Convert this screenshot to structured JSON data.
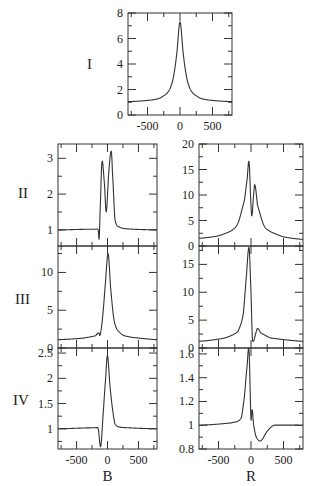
{
  "figure": {
    "row_labels": [
      "I",
      "II",
      "III",
      "IV"
    ],
    "column_labels": [
      "B",
      "R"
    ]
  },
  "chart_data": [
    {
      "id": "I",
      "type": "line",
      "title": "",
      "row_label": "I",
      "xlabel": "",
      "ylabel": "",
      "xlim": [
        -800,
        800
      ],
      "ylim": [
        0,
        8
      ],
      "xticks": [
        -500,
        0,
        500
      ],
      "yticks": [
        0,
        2,
        4,
        6,
        8
      ],
      "grid": false,
      "description": "Single symmetric Lorentzian-like peak centered at 0",
      "x": [
        -800,
        -600,
        -400,
        -300,
        -200,
        -150,
        -100,
        -50,
        0,
        50,
        100,
        150,
        200,
        300,
        400,
        600,
        800
      ],
      "values": [
        1.05,
        1.1,
        1.2,
        1.35,
        1.7,
        2.1,
        3.0,
        4.8,
        7.3,
        4.8,
        3.0,
        2.1,
        1.7,
        1.35,
        1.2,
        1.1,
        1.05
      ]
    },
    {
      "id": "II-B",
      "type": "line",
      "row_label": "II",
      "xlabel": "",
      "xlim": [
        -800,
        800
      ],
      "ylim": [
        0.5,
        3.4
      ],
      "xticks": [
        -500,
        0,
        500
      ],
      "yticks": [
        1,
        2,
        3
      ],
      "grid": false,
      "description": "Flat at 1 with small dip near -130, then double peak (2.9 at -90, dip 1.5 at -20, 3.2 at 60)",
      "x": [
        -800,
        -200,
        -150,
        -135,
        -120,
        -90,
        -50,
        -20,
        20,
        60,
        80,
        120,
        200,
        400,
        800
      ],
      "values": [
        1.0,
        1.02,
        1.0,
        0.75,
        1.5,
        2.9,
        2.3,
        1.5,
        2.6,
        3.2,
        2.6,
        1.3,
        1.07,
        1.02,
        1.0
      ]
    },
    {
      "id": "II-R",
      "type": "line",
      "row_label": "II",
      "xlim": [
        -800,
        800
      ],
      "ylim": [
        0,
        20
      ],
      "xticks": [
        -500,
        0,
        500
      ],
      "yticks": [
        0,
        5,
        10,
        15,
        20
      ],
      "grid": false,
      "description": "Double peak: 16.5 at -30, dip ~6 at 15, 12 at 60",
      "x": [
        -800,
        -500,
        -300,
        -200,
        -100,
        -60,
        -30,
        0,
        15,
        40,
        60,
        100,
        200,
        300,
        500,
        800
      ],
      "values": [
        1.5,
        2.0,
        3.0,
        4.5,
        9.0,
        13.0,
        16.5,
        8.0,
        6.0,
        10.0,
        12.0,
        8.0,
        4.0,
        2.8,
        1.8,
        1.3
      ]
    },
    {
      "id": "III-B",
      "type": "line",
      "row_label": "III",
      "xlim": [
        -800,
        800
      ],
      "ylim": [
        0,
        14
      ],
      "xticks": [
        -500,
        0,
        500
      ],
      "yticks": [
        0,
        5,
        10
      ],
      "grid": false,
      "description": "Small kink near -130 then sharp peak of ~12.5 near 10",
      "x": [
        -800,
        -400,
        -200,
        -140,
        -120,
        -80,
        -40,
        10,
        50,
        100,
        150,
        250,
        400,
        800
      ],
      "values": [
        1.1,
        1.3,
        1.6,
        2.0,
        1.7,
        4.0,
        8.0,
        12.5,
        8.0,
        4.0,
        2.5,
        1.7,
        1.4,
        1.1
      ],
      "annotations": [
        "small kink near x=-130"
      ]
    },
    {
      "id": "III-R",
      "type": "line",
      "row_label": "III",
      "xlim": [
        -800,
        800
      ],
      "ylim": [
        0,
        18
      ],
      "xticks": [
        -500,
        0,
        500
      ],
      "yticks": [
        0,
        5,
        10,
        15
      ],
      "grid": false,
      "description": "Tall peak ~18 at -30, dip ~1.3 at 40, small secondary peak ~3.5 at 100",
      "x": [
        -800,
        -400,
        -200,
        -120,
        -70,
        -30,
        0,
        20,
        40,
        70,
        100,
        150,
        300,
        800
      ],
      "values": [
        1.2,
        1.8,
        3.0,
        6.0,
        13.0,
        18.0,
        10.0,
        2.0,
        1.3,
        2.5,
        3.5,
        2.7,
        1.8,
        1.2
      ]
    },
    {
      "id": "IV-B",
      "type": "line",
      "row_label": "IV",
      "xlabel": "B",
      "xlim": [
        -800,
        800
      ],
      "ylim": [
        0.6,
        2.6
      ],
      "xticks": [
        -500,
        0,
        500
      ],
      "xticklabels": [
        "-500",
        "0",
        "500"
      ],
      "yticks": [
        1,
        1.5,
        2,
        2.5
      ],
      "grid": false,
      "description": "Flat at 1, sharp dip to ~0.65 near -110, peak ~2.45 at 0, decays with shoulder",
      "x": [
        -800,
        -200,
        -150,
        -110,
        -70,
        -30,
        0,
        40,
        80,
        120,
        200,
        800
      ],
      "values": [
        1.0,
        1.02,
        1.0,
        0.65,
        1.3,
        2.0,
        2.45,
        1.85,
        1.4,
        1.1,
        1.03,
        1.0
      ]
    },
    {
      "id": "IV-R",
      "type": "line",
      "row_label": "IV",
      "xlabel": "R",
      "xlim": [
        -800,
        800
      ],
      "ylim": [
        0.8,
        1.65
      ],
      "xticks": [
        -500,
        0,
        500
      ],
      "xticklabels": [
        "-500",
        "0",
        "500"
      ],
      "yticks": [
        0.8,
        1.0,
        1.2,
        1.4,
        1.6
      ],
      "grid": false,
      "description": "Flat at 1, peak ~1.63 near -30, small bump ~1.13 at 20, dip ~0.87 near 150, recovers to 1",
      "x": [
        -800,
        -300,
        -150,
        -100,
        -60,
        -30,
        0,
        10,
        20,
        40,
        80,
        150,
        250,
        350,
        800
      ],
      "values": [
        1.0,
        1.02,
        1.06,
        1.25,
        1.5,
        1.63,
        1.05,
        1.1,
        1.13,
        1.0,
        0.9,
        0.87,
        0.95,
        1.0,
        1.0
      ]
    }
  ]
}
